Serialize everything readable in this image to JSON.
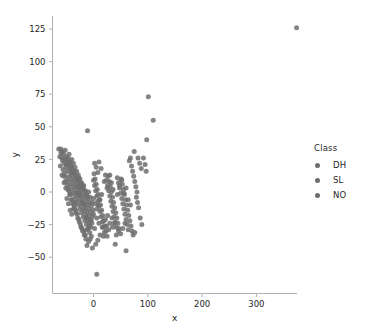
{
  "chart_data": {
    "type": "scatter",
    "title": "",
    "xlabel": "x",
    "ylabel": "y",
    "xlim": [
      -110,
      400
    ],
    "ylim": [
      -75,
      138
    ],
    "xticks": [
      0,
      100,
      200,
      300
    ],
    "yticks": [
      -50,
      -25,
      0,
      25,
      50,
      75,
      100,
      125
    ],
    "grid": false,
    "legend": {
      "title": "Class",
      "position": "right",
      "entries": [
        {
          "label": "DH",
          "color": "#6e6e6e"
        },
        {
          "label": "SL",
          "color": "#6e6e6e"
        },
        {
          "label": "NO",
          "color": "#6e6e6e"
        }
      ]
    },
    "marker": {
      "color": "#6e6e6e",
      "size": 5,
      "opacity": 0.85
    },
    "points": [
      [
        374,
        126
      ],
      [
        101,
        73
      ],
      [
        110,
        55
      ],
      [
        98,
        40
      ],
      [
        -11,
        47
      ],
      [
        6,
        -63
      ],
      [
        -64,
        33
      ],
      [
        -60,
        33
      ],
      [
        -57,
        31
      ],
      [
        -55,
        29
      ],
      [
        -52,
        32
      ],
      [
        -50,
        27
      ],
      [
        -49,
        24
      ],
      [
        -47,
        26
      ],
      [
        -46,
        21
      ],
      [
        -45,
        29
      ],
      [
        -44,
        18
      ],
      [
        -43,
        23
      ],
      [
        -42,
        15
      ],
      [
        -41,
        20
      ],
      [
        -40,
        25
      ],
      [
        -39,
        12
      ],
      [
        -38,
        17
      ],
      [
        -37,
        22
      ],
      [
        -36,
        9
      ],
      [
        -35,
        14
      ],
      [
        -34,
        19
      ],
      [
        -33,
        6
      ],
      [
        -32,
        11
      ],
      [
        -31,
        16
      ],
      [
        -30,
        3
      ],
      [
        -29,
        8
      ],
      [
        -28,
        13
      ],
      [
        -27,
        0
      ],
      [
        -26,
        5
      ],
      [
        -25,
        10
      ],
      [
        -24,
        -3
      ],
      [
        -23,
        2
      ],
      [
        -22,
        7
      ],
      [
        -21,
        -6
      ],
      [
        -20,
        -1
      ],
      [
        -19,
        4
      ],
      [
        -18,
        -9
      ],
      [
        -17,
        -4
      ],
      [
        -16,
        1
      ],
      [
        -15,
        -12
      ],
      [
        -14,
        -7
      ],
      [
        -13,
        -2
      ],
      [
        -12,
        -15
      ],
      [
        -11,
        -10
      ],
      [
        -10,
        -5
      ],
      [
        -9,
        -18
      ],
      [
        -8,
        -13
      ],
      [
        -7,
        -8
      ],
      [
        -6,
        -21
      ],
      [
        -5,
        -16
      ],
      [
        -4,
        -11
      ],
      [
        -3,
        -24
      ],
      [
        -2,
        -19
      ],
      [
        -1,
        -14
      ],
      [
        -58,
        26
      ],
      [
        -54,
        22
      ],
      [
        -51,
        19
      ],
      [
        -48,
        16
      ],
      [
        -44,
        12
      ],
      [
        -41,
        9
      ],
      [
        -38,
        6
      ],
      [
        -35,
        3
      ],
      [
        -32,
        0
      ],
      [
        -29,
        -3
      ],
      [
        -26,
        -6
      ],
      [
        -23,
        -9
      ],
      [
        -20,
        -12
      ],
      [
        -17,
        -15
      ],
      [
        -14,
        -18
      ],
      [
        -11,
        -21
      ],
      [
        -8,
        -24
      ],
      [
        -5,
        -27
      ],
      [
        -56,
        17
      ],
      [
        -53,
        14
      ],
      [
        -49,
        11
      ],
      [
        -46,
        8
      ],
      [
        -43,
        5
      ],
      [
        -40,
        2
      ],
      [
        -37,
        -1
      ],
      [
        -34,
        -4
      ],
      [
        -31,
        -7
      ],
      [
        -28,
        -10
      ],
      [
        -25,
        -13
      ],
      [
        -22,
        -16
      ],
      [
        -19,
        -19
      ],
      [
        -16,
        -22
      ],
      [
        -13,
        -25
      ],
      [
        -10,
        -28
      ],
      [
        -7,
        -31
      ],
      [
        -4,
        -34
      ],
      [
        -47,
        2
      ],
      [
        -44,
        -2
      ],
      [
        -41,
        -6
      ],
      [
        -38,
        -9
      ],
      [
        -35,
        -12
      ],
      [
        -32,
        -16
      ],
      [
        -29,
        -20
      ],
      [
        -26,
        -23
      ],
      [
        -23,
        -27
      ],
      [
        -20,
        -30
      ],
      [
        -17,
        -33
      ],
      [
        -14,
        -36
      ],
      [
        -12,
        -41
      ],
      [
        -9,
        -38
      ],
      [
        0,
        9
      ],
      [
        2,
        5
      ],
      [
        4,
        1
      ],
      [
        6,
        -3
      ],
      [
        8,
        -7
      ],
      [
        10,
        -11
      ],
      [
        12,
        -15
      ],
      [
        14,
        -19
      ],
      [
        16,
        -23
      ],
      [
        18,
        -27
      ],
      [
        20,
        -31
      ],
      [
        1,
        14
      ],
      [
        3,
        10
      ],
      [
        5,
        6
      ],
      [
        7,
        2
      ],
      [
        9,
        -2
      ],
      [
        11,
        -6
      ],
      [
        13,
        -10
      ],
      [
        15,
        -14
      ],
      [
        17,
        -18
      ],
      [
        19,
        -22
      ],
      [
        21,
        -26
      ],
      [
        23,
        -30
      ],
      [
        25,
        -34
      ],
      [
        22,
        13
      ],
      [
        24,
        9
      ],
      [
        26,
        5
      ],
      [
        28,
        1
      ],
      [
        30,
        -3
      ],
      [
        32,
        -7
      ],
      [
        34,
        -11
      ],
      [
        36,
        -15
      ],
      [
        38,
        -19
      ],
      [
        40,
        -23
      ],
      [
        42,
        -27
      ],
      [
        27,
        12
      ],
      [
        29,
        8
      ],
      [
        31,
        4
      ],
      [
        33,
        0
      ],
      [
        35,
        -4
      ],
      [
        37,
        -8
      ],
      [
        39,
        -12
      ],
      [
        41,
        -16
      ],
      [
        43,
        -20
      ],
      [
        45,
        -24
      ],
      [
        47,
        -28
      ],
      [
        44,
        11
      ],
      [
        46,
        7
      ],
      [
        48,
        3
      ],
      [
        50,
        -1
      ],
      [
        52,
        -5
      ],
      [
        54,
        -9
      ],
      [
        56,
        -13
      ],
      [
        58,
        -17
      ],
      [
        60,
        -21
      ],
      [
        62,
        -25
      ],
      [
        64,
        -29
      ],
      [
        51,
        10
      ],
      [
        53,
        6
      ],
      [
        55,
        2
      ],
      [
        57,
        -2
      ],
      [
        59,
        -6
      ],
      [
        61,
        -10
      ],
      [
        63,
        -14
      ],
      [
        65,
        -18
      ],
      [
        67,
        -22
      ],
      [
        69,
        -26
      ],
      [
        71,
        -30
      ],
      [
        70,
        20
      ],
      [
        72,
        16
      ],
      [
        74,
        12
      ],
      [
        76,
        8
      ],
      [
        78,
        4
      ],
      [
        80,
        0
      ],
      [
        66,
        24
      ],
      [
        68,
        26
      ],
      [
        75,
        31
      ],
      [
        82,
        26
      ],
      [
        85,
        22
      ],
      [
        88,
        18
      ],
      [
        92,
        26
      ],
      [
        95,
        21
      ],
      [
        97,
        16
      ],
      [
        79,
        -4
      ],
      [
        81,
        -8
      ],
      [
        83,
        -12
      ],
      [
        86,
        -20
      ],
      [
        89,
        -25
      ],
      [
        73,
        -33
      ],
      [
        76,
        -31
      ],
      [
        60,
        -45
      ],
      [
        40,
        -40
      ],
      [
        35,
        -27
      ],
      [
        28,
        -29
      ],
      [
        24,
        -26
      ],
      [
        18,
        -34
      ],
      [
        12,
        -33
      ],
      [
        8,
        -37
      ],
      [
        4,
        -40
      ],
      [
        -2,
        -43
      ],
      [
        2,
        -28
      ],
      [
        -6,
        -36
      ],
      [
        -60,
        30
      ],
      [
        -57,
        24
      ],
      [
        -53,
        25
      ],
      [
        -50,
        21
      ],
      [
        -46,
        23
      ],
      [
        -42,
        19
      ],
      [
        -39,
        15
      ],
      [
        -36,
        16
      ],
      [
        -33,
        12
      ],
      [
        -30,
        9
      ],
      [
        -27,
        11
      ],
      [
        -24,
        7
      ],
      [
        -21,
        3
      ],
      [
        -18,
        5
      ],
      [
        -15,
        1
      ],
      [
        -12,
        -3
      ],
      [
        -9,
        0
      ],
      [
        -6,
        -4
      ],
      [
        -3,
        -8
      ],
      [
        0,
        -5
      ],
      [
        3,
        -9
      ],
      [
        6,
        -13
      ],
      [
        9,
        -10
      ],
      [
        12,
        -6
      ],
      [
        15,
        -2
      ],
      [
        -55,
        12
      ],
      [
        -52,
        8
      ],
      [
        -48,
        5
      ],
      [
        -45,
        1
      ],
      [
        -42,
        -2
      ],
      [
        -39,
        -6
      ],
      [
        -36,
        -10
      ],
      [
        -33,
        -14
      ],
      [
        -30,
        -17
      ],
      [
        -27,
        -21
      ],
      [
        -24,
        -25
      ],
      [
        -21,
        -28
      ],
      [
        -18,
        -30
      ],
      [
        -15,
        -33
      ],
      [
        -12,
        -29
      ],
      [
        5,
        19
      ],
      [
        10,
        23
      ],
      [
        14,
        18
      ],
      [
        8,
        15
      ],
      [
        2,
        22
      ],
      [
        20,
        8
      ],
      [
        25,
        3
      ],
      [
        30,
        13
      ],
      [
        33,
        7
      ],
      [
        36,
        2
      ],
      [
        44,
        -2
      ],
      [
        48,
        5
      ],
      [
        52,
        9
      ],
      [
        56,
        -1
      ],
      [
        60,
        3
      ],
      [
        64,
        -6
      ],
      [
        68,
        -10
      ],
      [
        58,
        -24
      ],
      [
        54,
        -28
      ],
      [
        50,
        -32
      ],
      [
        46,
        -30
      ],
      [
        42,
        -33
      ],
      [
        38,
        -24
      ],
      [
        34,
        -20
      ],
      [
        30,
        -24
      ],
      [
        26,
        -18
      ],
      [
        22,
        -21
      ],
      [
        16,
        -27
      ],
      [
        10,
        -24
      ],
      [
        6,
        -20
      ],
      [
        0,
        -17
      ],
      [
        -4,
        -22
      ],
      [
        -8,
        -26
      ],
      [
        -13,
        -20
      ],
      [
        -16,
        -10
      ],
      [
        -20,
        -8
      ],
      [
        -25,
        -2
      ],
      [
        -28,
        4
      ],
      [
        -31,
        -1
      ],
      [
        -34,
        -8
      ],
      [
        -37,
        -13
      ],
      [
        -40,
        -17
      ],
      [
        -43,
        -14
      ],
      [
        -46,
        -9
      ],
      [
        -49,
        -5
      ],
      [
        -51,
        3
      ],
      [
        -54,
        7
      ],
      [
        -58,
        13
      ],
      [
        -61,
        20
      ],
      [
        -62,
        27
      ]
    ]
  },
  "axes": {
    "xlabel": "x",
    "ylabel": "y",
    "xtick_labels": [
      "0",
      "100",
      "200",
      "300"
    ],
    "ytick_labels": [
      "-50",
      "-25",
      "0",
      "25",
      "50",
      "75",
      "100",
      "125"
    ]
  },
  "legend": {
    "title": "Class",
    "items": [
      "DH",
      "SL",
      "NO"
    ]
  },
  "style": {
    "background": "#ffffff",
    "point_color": "#6e6e6e",
    "axis_color": "#b0b0b0",
    "text_color": "#262626"
  }
}
